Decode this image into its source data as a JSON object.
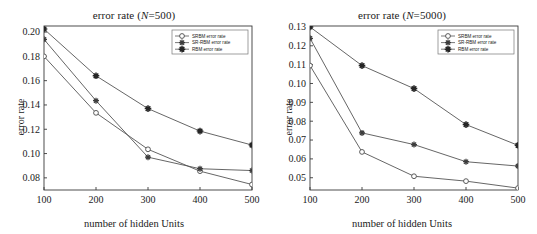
{
  "figure": {
    "panel_count": 2
  },
  "chart_data": [
    {
      "type": "line",
      "title": "error rate (N=500)",
      "title_prefix": "error rate (",
      "title_var": "N",
      "title_suffix": "=500)",
      "xlabel": "number of hidden Units",
      "ylabel": "error rate",
      "x": [
        100,
        200,
        300,
        400,
        500
      ],
      "xtick_labels": [
        "100",
        "200",
        "300",
        "400",
        "500"
      ],
      "xlim": [
        100,
        500
      ],
      "ylim": [
        0.07,
        0.205
      ],
      "ytick_values": [
        0.08,
        0.1,
        0.12,
        0.14,
        0.16,
        0.18,
        0.2
      ],
      "ytick_labels": [
        "0.08",
        "0.10",
        "0.12",
        "0.14",
        "0.16",
        "0.18",
        "0.20"
      ],
      "grid": false,
      "legend_position": "top-right",
      "series": [
        {
          "name": "SRBM error rate",
          "marker": "open-circle",
          "values": [
            0.18,
            0.1335,
            0.1035,
            0.0855,
            0.0745
          ]
        },
        {
          "name": "SR-RBM error rate",
          "marker": "plus-star",
          "values": [
            0.194,
            0.1435,
            0.097,
            0.0875,
            0.086
          ]
        },
        {
          "name": "RBM error rate",
          "marker": "filled-star",
          "values": [
            0.2025,
            0.164,
            0.137,
            0.1185,
            0.107
          ]
        }
      ]
    },
    {
      "type": "line",
      "title": "error rate (N=5000)",
      "title_prefix": "error rate (",
      "title_var": "N",
      "title_suffix": "=5000)",
      "xlabel": "number of hidden Units",
      "ylabel": "error rate",
      "x": [
        100,
        200,
        300,
        400,
        500
      ],
      "xtick_labels": [
        "100",
        "200",
        "300",
        "400",
        "500"
      ],
      "xlim": [
        100,
        500
      ],
      "ylim": [
        0.0435,
        0.1305
      ],
      "ytick_values": [
        0.05,
        0.06,
        0.07,
        0.08,
        0.09,
        0.1,
        0.11,
        0.12,
        0.13
      ],
      "ytick_labels": [
        "0.05",
        "0.06",
        "0.07",
        "0.08",
        "0.09",
        "0.10",
        "0.11",
        "0.12",
        "0.13"
      ],
      "grid": false,
      "legend_position": "top-right",
      "series": [
        {
          "name": "SRBM error rate",
          "marker": "open-circle",
          "values": [
            0.1095,
            0.0637,
            0.0508,
            0.0482,
            0.0445
          ]
        },
        {
          "name": "SR-RBM error rate",
          "marker": "plus-star",
          "values": [
            0.124,
            0.0738,
            0.0676,
            0.0585,
            0.0562
          ]
        },
        {
          "name": "RBM error rate",
          "marker": "filled-star",
          "values": [
            0.13,
            0.1095,
            0.0973,
            0.0782,
            0.0672
          ]
        }
      ]
    }
  ],
  "colors": {
    "axis": "#3a3a3a",
    "line": "#555555",
    "text": "#1a1a1a",
    "background": "#ffffff"
  }
}
